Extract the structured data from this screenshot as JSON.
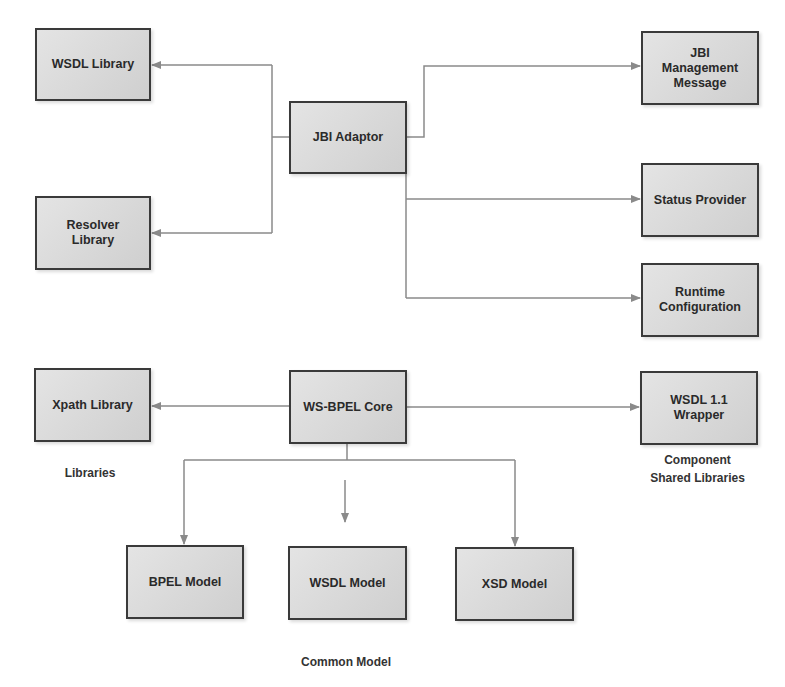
{
  "nodes": {
    "wsdl_library": "WSDL Library",
    "resolver_library": "Resolver Library",
    "jbi_adaptor": "JBI Adaptor",
    "jbi_management_message": "JBI Management Message",
    "status_provider": "Status Provider",
    "runtime_configuration": "Runtime Configuration",
    "xpath_library": "Xpath Library",
    "ws_bpel_core": "WS-BPEL Core",
    "wsdl_wrapper": "WSDL 1.1 Wrapper",
    "bpel_model": "BPEL Model",
    "wsdl_model": "WSDL Model",
    "xsd_model": "XSD Model"
  },
  "groups": {
    "libraries": "Libraries",
    "component_shared_libraries": "Component Shared Libraries",
    "common_model": "Common Model"
  },
  "colors": {
    "edge": "#8a8a8a",
    "border": "#3a3a3a",
    "fill": "#dadada"
  }
}
